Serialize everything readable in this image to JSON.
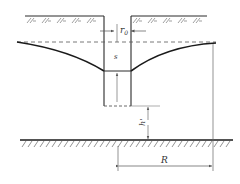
{
  "diagram": {
    "type": "well-drawdown-cross-section",
    "labels": {
      "r0": "r",
      "r0_sub": "0",
      "s": "s",
      "h_prime": "h'",
      "R": "R"
    },
    "colors": {
      "line": "#2a2a2a",
      "hatch": "#555555",
      "dim": "#666666",
      "background": "#ffffff"
    }
  }
}
